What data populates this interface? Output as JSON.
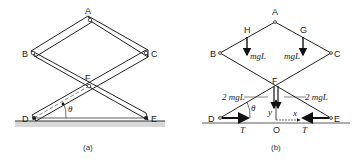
{
  "figure_a": {
    "caption": "(a)",
    "points": {
      "A": "A",
      "B": "B",
      "C": "C",
      "D": "D",
      "E": "E",
      "F": "F"
    },
    "angle": "θ"
  },
  "figure_b": {
    "caption": "(b)",
    "points": {
      "A": "A",
      "B": "B",
      "C": "C",
      "D": "D",
      "E": "E",
      "F": "F",
      "G": "G",
      "H": "H",
      "O": "O"
    },
    "forces": {
      "weight_left": "mgL",
      "weight_right": "mgL",
      "center_left": "2 mgL",
      "center_right": "2 mgL",
      "tension_left": "T",
      "tension_right": "T"
    },
    "axes": {
      "x": "x",
      "y": "y"
    },
    "angle": "θ"
  }
}
